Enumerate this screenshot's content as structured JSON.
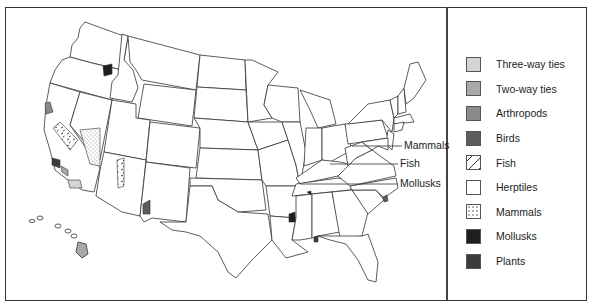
{
  "map": {
    "title": "",
    "region": "United States",
    "callouts": [
      {
        "label": "Mammals",
        "y": 146
      },
      {
        "label": "Fish",
        "y": 164
      },
      {
        "label": "Mollusks",
        "y": 184
      }
    ]
  },
  "legend": {
    "items": [
      {
        "label": "Three-way ties",
        "pattern": "solid",
        "color": "#d4d4d4"
      },
      {
        "label": "Two-way ties",
        "pattern": "solid",
        "color": "#a9a9a9"
      },
      {
        "label": "Arthropods",
        "pattern": "solid",
        "color": "#8a8a8a"
      },
      {
        "label": "Birds",
        "pattern": "solid",
        "color": "#5c5c5c"
      },
      {
        "label": "Fish",
        "pattern": "dashes",
        "color": "#ffffff"
      },
      {
        "label": "Herptiles",
        "pattern": "solid",
        "color": "#ffffff"
      },
      {
        "label": "Mammals",
        "pattern": "dots",
        "color": "#ffffff"
      },
      {
        "label": "Mollusks",
        "pattern": "solid",
        "color": "#1e1e1e"
      },
      {
        "label": "Plants",
        "pattern": "solid",
        "color": "#3c3c3c"
      }
    ]
  }
}
